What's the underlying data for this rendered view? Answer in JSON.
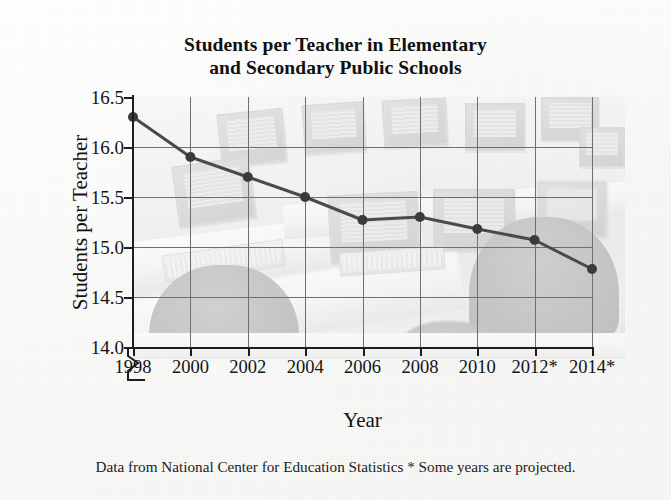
{
  "chart_data": {
    "type": "line",
    "title": "Students per Teacher in Elementary and Secondary Public Schools",
    "title_line1": "Students per Teacher in Elementary",
    "title_line2": "and Secondary Public Schools",
    "xlabel": "Year",
    "ylabel": "Students per Teacher",
    "categories": [
      "1998",
      "2000",
      "2002",
      "2004",
      "2006",
      "2008",
      "2010",
      "2012*",
      "2014*"
    ],
    "values": [
      16.3,
      15.9,
      15.7,
      15.5,
      15.27,
      15.3,
      15.18,
      15.07,
      14.78
    ],
    "x": [
      1998,
      2000,
      2002,
      2004,
      2006,
      2008,
      2010,
      2012,
      2014
    ],
    "ylim": [
      14.0,
      16.5
    ],
    "ytick_labels": [
      "16.5",
      "16.0",
      "15.5",
      "15.0",
      "14.5",
      "14.0"
    ],
    "ytick_values": [
      16.5,
      16.0,
      15.5,
      15.0,
      14.5,
      14.0
    ],
    "xtick_labels": [
      "1998",
      "2000",
      "2002",
      "2004",
      "2006",
      "2008",
      "2010",
      "2012*",
      "2014*"
    ],
    "grid": true,
    "legend": "none",
    "y_axis_break": true,
    "series_color": "#4a4a4a",
    "marker_color": "#3a3a3a",
    "grid_color": "#6f6f6f",
    "axis_color": "#1d1d1d",
    "annotation": "* Some years are projected.",
    "background_image": "faded grayscale photo of a computer lab with monitors, keyboards and chairs"
  },
  "footnote": {
    "text": "Data from National Center for Education Statistics  * Some years are projected.",
    "source": "National Center for Education Statistics",
    "projection_note": "* Some years are projected."
  }
}
